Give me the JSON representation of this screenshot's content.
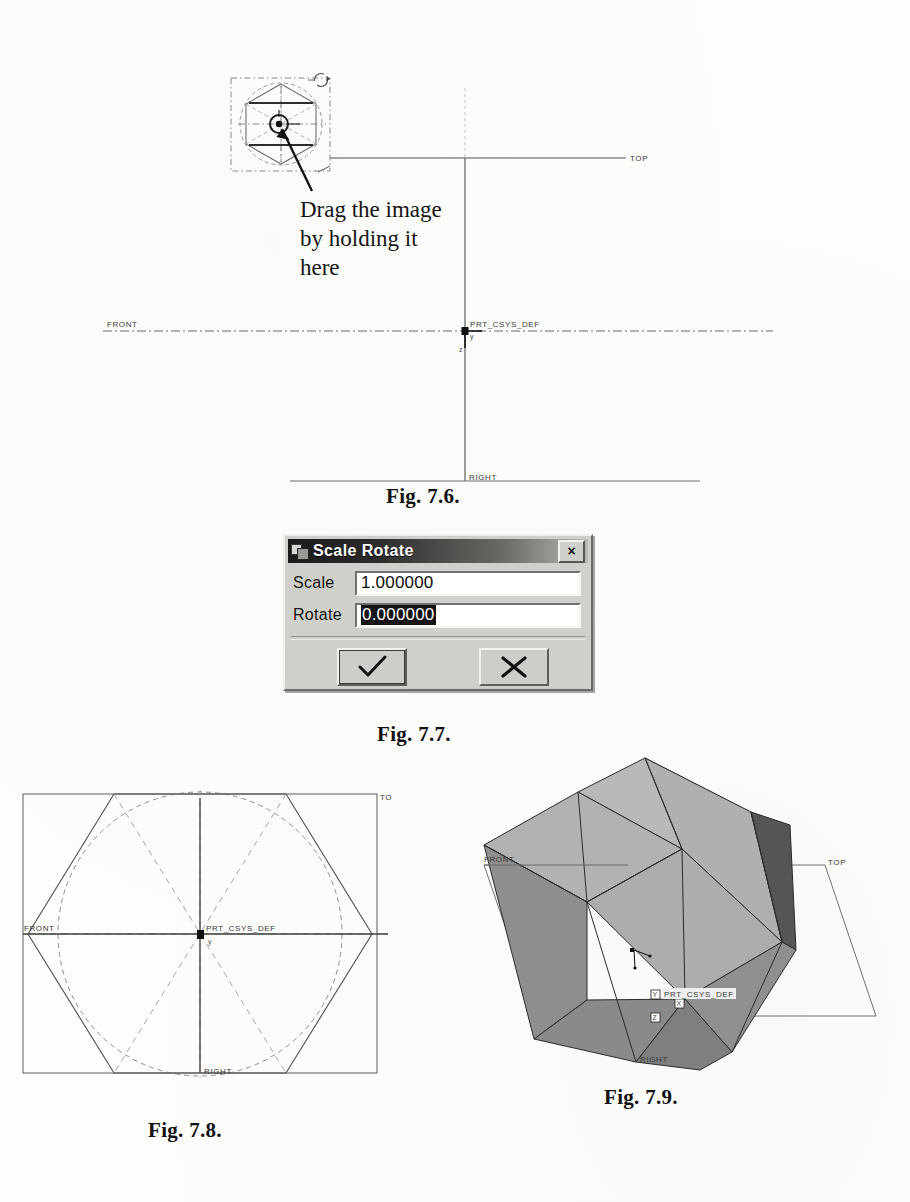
{
  "page": {
    "kind": "scanned-textbook-page",
    "background": "#fdfdfc"
  },
  "figures": [
    {
      "id": "fig-7-6",
      "caption": "Fig. 7.6.",
      "annotation": [
        "Drag the image",
        "by holding it",
        "here"
      ],
      "datum_labels": [
        "TOP",
        "FRONT",
        "RIGHT"
      ],
      "csys_label": "PRT_CSYS_DEF",
      "axis_labels": [
        "y",
        "z"
      ],
      "handles": [
        "rotate-handle",
        "drag-center-handle"
      ],
      "shape": "hexagon-sketch-in-selection-box"
    },
    {
      "id": "fig-7-7",
      "caption": "Fig. 7.7.",
      "dialog": {
        "title": "Scale Rotate",
        "close_label": "×",
        "fields": [
          {
            "label": "Scale",
            "value": "1.000000",
            "selected": false
          },
          {
            "label": "Rotate",
            "value": "0.000000",
            "selected": true
          }
        ],
        "buttons": [
          {
            "name": "accept",
            "glyph": "✓"
          },
          {
            "name": "cancel",
            "glyph": "✕"
          }
        ],
        "colors": {
          "face": "#cfcfcb",
          "titlebar_dark": "#1b1b1b",
          "titlebar_light": "#b9b9b4",
          "field_bg": "#ffffff",
          "selection_bg": "#141414",
          "selection_fg": "#ffffff"
        }
      }
    },
    {
      "id": "fig-7-8",
      "caption": "Fig. 7.8.",
      "datum_labels": [
        "TO",
        "FRONT",
        "RIGHT"
      ],
      "csys_label": "PRT_CSYS_DEF",
      "shape": "hexagon-inscribed-in-dashed-circle"
    },
    {
      "id": "fig-7-9",
      "caption": "Fig. 7.9.",
      "datum_labels": [
        "FRONT",
        "TOP",
        "RIGHT"
      ],
      "csys_label": "PRT_CSYS_DEF",
      "axis_labels": [
        "Y",
        "X",
        "Z"
      ],
      "shape": "shaded-hexagonal-prism-3d",
      "colors": {
        "face_top": "#b4b4b4",
        "face_left": "#9a9a9a",
        "face_right": "#8a8a8a",
        "face_dark": "#575757",
        "outline": "#2b2b2b"
      }
    }
  ]
}
